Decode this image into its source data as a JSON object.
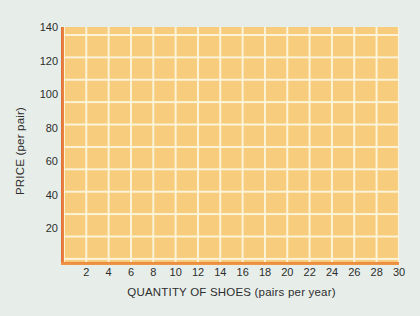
{
  "colors": {
    "page_bg": "#e7eee9",
    "plot_bg": "#f7cd7d",
    "grid_line": "#fcf4da",
    "axis_line": "#ec8740",
    "text": "#2d2d2d"
  },
  "chart_data": {
    "type": "line",
    "title": "",
    "xlabel": "QUANTITY OF SHOES (pairs per year)",
    "ylabel": "PRICE (per pair)",
    "xlim": [
      0,
      30
    ],
    "ylim": [
      0,
      140
    ],
    "x_ticks": [
      2,
      4,
      6,
      8,
      10,
      12,
      14,
      16,
      18,
      20,
      22,
      24,
      26,
      28,
      30
    ],
    "y_ticks": [
      20,
      40,
      60,
      80,
      100,
      120,
      140
    ],
    "series": [],
    "grid": "on",
    "legend": "none",
    "note": "Blank graph-paper grid; axes labeled but no data series plotted."
  }
}
